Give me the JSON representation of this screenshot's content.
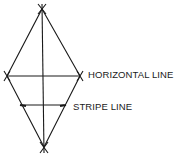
{
  "diagram": {
    "labels": {
      "horizontal": "HORIZONTAL LINE",
      "stripe": "STRIPE LINE"
    },
    "colors": {
      "line": "#1a1a1a",
      "background": "#ffffff"
    }
  }
}
